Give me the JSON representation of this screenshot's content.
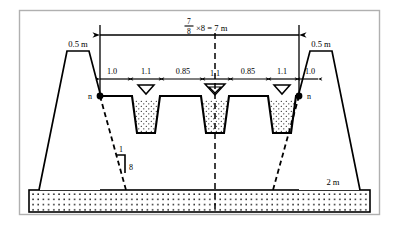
{
  "figure": {
    "frame_color": "#b0b0b0",
    "line_color": "#000000",
    "fill_color": "#ffffff"
  },
  "span": {
    "numerator": "7",
    "denominator": "8",
    "multiplier": "×8 = 7 m",
    "full_text": "7/8 ×8 = 7 m"
  },
  "dimensions": {
    "labels": [
      "1.0",
      "1.1",
      "0.85",
      "1.1",
      "0.85",
      "1.1",
      "1.0"
    ],
    "positions_x": [
      112,
      146,
      183,
      215,
      248,
      282,
      310
    ]
  },
  "embankments": {
    "left_crest_label": "0.5 m",
    "right_crest_label": "0.5 m"
  },
  "nodes": {
    "left_label": "n",
    "right_label": "n"
  },
  "slope_marker": {
    "horizontal_label": "1",
    "vertical_label": "8"
  },
  "base": {
    "thickness_label": "2 m"
  },
  "trenches": [
    {
      "name": "left-trench",
      "center_x": 146,
      "water_marker": "single"
    },
    {
      "name": "center-trench",
      "center_x": 215,
      "water_marker": "double"
    },
    {
      "name": "right-trench",
      "center_x": 282,
      "water_marker": "single"
    }
  ]
}
